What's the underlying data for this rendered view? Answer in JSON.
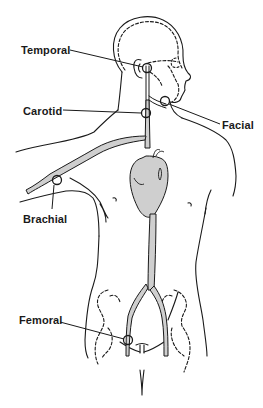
{
  "diagram": {
    "type": "anatomical illustration",
    "colors": {
      "line": "#1a1a1a",
      "artery_fill": "#cfcfcf",
      "heart_fill": "#cdcdcd",
      "background": "#ffffff"
    },
    "labels": [
      {
        "id": "temporal",
        "text": "Temporal"
      },
      {
        "id": "carotid",
        "text": "Carotid"
      },
      {
        "id": "facial",
        "text": "Facial"
      },
      {
        "id": "brachial",
        "text": "Brachial"
      },
      {
        "id": "femoral",
        "text": "Femoral"
      }
    ],
    "pulse_points": [
      {
        "name": "temporal",
        "location": "side of head in front of ear"
      },
      {
        "name": "facial",
        "location": "lower jaw"
      },
      {
        "name": "carotid",
        "location": "neck"
      },
      {
        "name": "brachial",
        "location": "upper arm"
      },
      {
        "name": "femoral",
        "location": "groin"
      }
    ]
  }
}
